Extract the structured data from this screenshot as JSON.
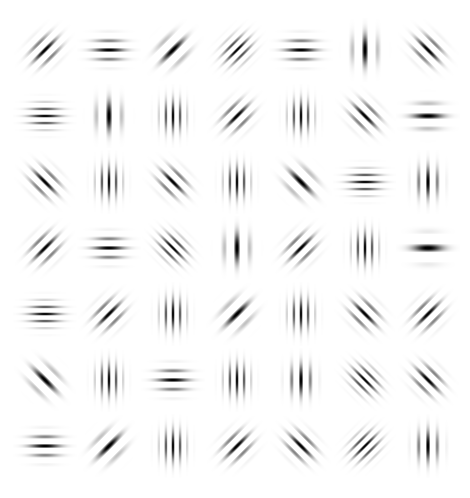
{
  "stimulus": {
    "type": "gabor-patch-grid",
    "rows": 7,
    "cols": 7,
    "background": "#ffffff",
    "ink": "#000000",
    "col_centers": [
      45,
      109,
      173,
      237,
      301,
      365,
      428
    ],
    "row_centers": [
      50,
      116,
      182,
      248,
      314,
      380,
      446
    ],
    "patch_size": 64,
    "sigma": 7.5,
    "orientation_legend": {
      "h": "horizontal stripes (0°)",
      "v": "vertical stripes (90°)",
      "d1": "diagonal stripes top-left to bottom-right (\\)",
      "d2": "diagonal stripes bottom-left to top-right (/)"
    },
    "patches": [
      [
        {
          "o": "d1",
          "f": "mid"
        },
        {
          "o": "h",
          "f": "mid"
        },
        {
          "o": "d1",
          "f": "low"
        },
        {
          "o": "d1",
          "f": "high"
        },
        {
          "o": "h",
          "f": "mid"
        },
        {
          "o": "v",
          "f": "low"
        },
        {
          "o": "d2",
          "f": "mid"
        }
      ],
      [
        {
          "o": "h",
          "f": "high"
        },
        {
          "o": "v",
          "f": "low"
        },
        {
          "o": "v",
          "f": "high"
        },
        {
          "o": "d1",
          "f": "mid"
        },
        {
          "o": "v",
          "f": "high"
        },
        {
          "o": "d2",
          "f": "mid"
        },
        {
          "o": "h",
          "f": "low"
        }
      ],
      [
        {
          "o": "d2",
          "f": "mid"
        },
        {
          "o": "v",
          "f": "high"
        },
        {
          "o": "d2",
          "f": "mid"
        },
        {
          "o": "v",
          "f": "high"
        },
        {
          "o": "d2",
          "f": "low"
        },
        {
          "o": "h",
          "f": "high"
        },
        {
          "o": "v",
          "f": "mid"
        }
      ],
      [
        {
          "o": "d1",
          "f": "mid"
        },
        {
          "o": "h",
          "f": "mid"
        },
        {
          "o": "d2",
          "f": "high"
        },
        {
          "o": "v",
          "f": "low"
        },
        {
          "o": "d1",
          "f": "mid"
        },
        {
          "o": "v",
          "f": "high"
        },
        {
          "o": "h",
          "f": "vlow"
        }
      ],
      [
        {
          "o": "h",
          "f": "high"
        },
        {
          "o": "d1",
          "f": "mid"
        },
        {
          "o": "v",
          "f": "high"
        },
        {
          "o": "d1",
          "f": "low"
        },
        {
          "o": "v",
          "f": "high"
        },
        {
          "o": "d2",
          "f": "mid"
        },
        {
          "o": "d1",
          "f": "mid"
        }
      ],
      [
        {
          "o": "d2",
          "f": "low"
        },
        {
          "o": "v",
          "f": "high"
        },
        {
          "o": "h",
          "f": "mid"
        },
        {
          "o": "v",
          "f": "high"
        },
        {
          "o": "v",
          "f": "mid"
        },
        {
          "o": "d2",
          "f": "high"
        },
        {
          "o": "d2",
          "f": "mid"
        }
      ],
      [
        {
          "o": "h",
          "f": "mid"
        },
        {
          "o": "d1",
          "f": "low"
        },
        {
          "o": "v",
          "f": "high"
        },
        {
          "o": "d1",
          "f": "mid"
        },
        {
          "o": "d2",
          "f": "mid"
        },
        {
          "o": "d1",
          "f": "high"
        },
        {
          "o": "v",
          "f": "mid"
        }
      ]
    ],
    "frequency_cycles_per_px": {
      "vlow": 0.055,
      "low": 0.075,
      "mid": 0.105,
      "high": 0.14
    }
  }
}
